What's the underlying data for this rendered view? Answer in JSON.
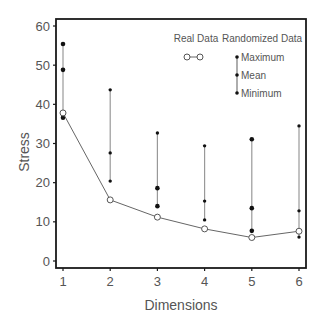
{
  "chart_data": {
    "type": "line",
    "title": "",
    "xlabel": "Dimensions",
    "ylabel": "Stress",
    "x": [
      1,
      2,
      3,
      4,
      5,
      6
    ],
    "xticks": [
      "1",
      "2",
      "3",
      "4",
      "5",
      "6"
    ],
    "yticks": [
      "0",
      "10",
      "20",
      "30",
      "40",
      "50",
      "60"
    ],
    "ylim": [
      0,
      60
    ],
    "grid": false,
    "legend_position": "upper right (inside)",
    "series": [
      {
        "name": "Real Data",
        "style": "line with open circles",
        "values": [
          37.8,
          15.6,
          11.2,
          8.2,
          6.0,
          7.6
        ]
      },
      {
        "name": "Randomized Data - Maximum",
        "style": "filled dot, range bar top",
        "values": [
          55.4,
          43.7,
          32.7,
          29.4,
          31.1,
          34.5
        ]
      },
      {
        "name": "Randomized Data - Mean",
        "style": "filled dot on range bar",
        "values": [
          48.8,
          27.6,
          18.6,
          15.3,
          13.5,
          12.8
        ]
      },
      {
        "name": "Randomized Data - Minimum",
        "style": "filled dot, range bar bottom",
        "values": [
          36.6,
          20.4,
          14.0,
          10.5,
          7.7,
          6.1
        ]
      }
    ],
    "legend": {
      "real_header": "Real Data",
      "random_header": "Randomized Data",
      "random_items": [
        "Maximum",
        "Mean",
        "Minimum"
      ]
    }
  },
  "colors": {
    "axis": "#1a1a1a",
    "line": "#666666",
    "range_bar": "#999999",
    "dot": "#111111",
    "text": "#555555"
  }
}
